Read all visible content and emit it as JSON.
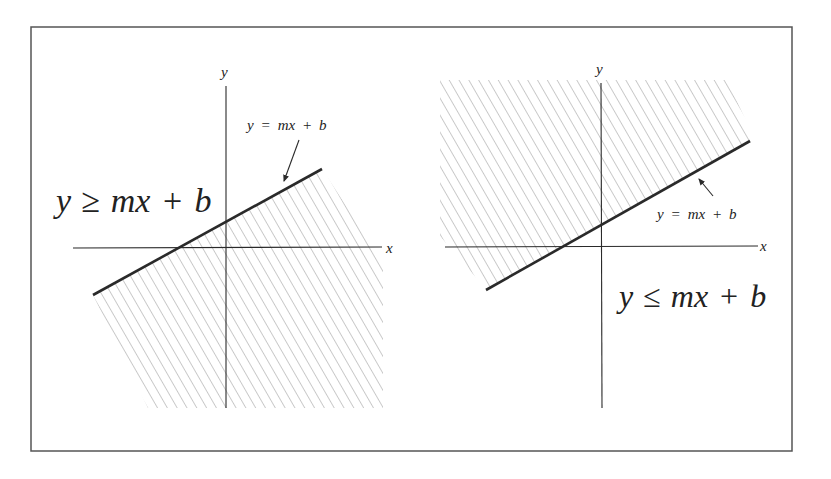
{
  "figure": {
    "frame": {
      "x": 31,
      "y": 27,
      "width": 761,
      "height": 424
    },
    "colors": {
      "ink": "#2a2a2a",
      "hatch": "#8a8a8a",
      "frame": "#555555",
      "background": "#ffffff"
    },
    "left_panel": {
      "x_axis_label": "x",
      "y_axis_label": "y",
      "boundary_label": {
        "y": "y",
        "eq": "=",
        "mx": "mx",
        "plus": "+",
        "b": "b"
      },
      "inequality_label": {
        "y": "y",
        "op": "≥",
        "mx": "mx",
        "plus": "+",
        "b": "b"
      },
      "inequality_text": "y ≥ mx + b",
      "boundary_text": "y = mx + b",
      "shaded_region": "below line (y ≥ mx + b shown with hatching below the boundary in original figure)"
    },
    "right_panel": {
      "x_axis_label": "x",
      "y_axis_label": "y",
      "boundary_label": {
        "y": "y",
        "eq": "=",
        "mx": "mx",
        "plus": "+",
        "b": "b"
      },
      "inequality_label": {
        "y": "y",
        "op": "≤",
        "mx": "mx",
        "plus": "+",
        "b": "b"
      },
      "inequality_text": "y ≤ mx + b",
      "boundary_text": "y = mx + b",
      "shaded_region": "above line"
    }
  }
}
